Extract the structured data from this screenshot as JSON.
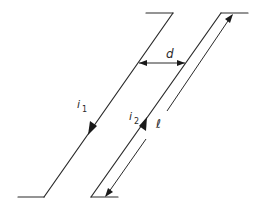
{
  "diagram": {
    "labels": {
      "separation": "d",
      "current_1_main": "i",
      "current_1_sub": "1",
      "current_2_main": "i",
      "current_2_sub": "2",
      "length": "ℓ"
    },
    "colors": {
      "line": "#2a2a2a",
      "background": "#ffffff"
    },
    "wires": [
      {
        "name": "wire-1",
        "current_direction": "down-left"
      },
      {
        "name": "wire-2",
        "current_direction": "up-right"
      }
    ]
  }
}
